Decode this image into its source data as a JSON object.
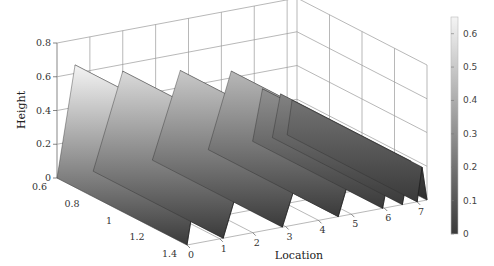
{
  "chart_data": {
    "type": "surface3d",
    "title": "",
    "xlabel": "Location",
    "ylabel": "",
    "zlabel": "Height",
    "x_ticks": [
      "0",
      "1",
      "2",
      "3",
      "4",
      "5",
      "6",
      "7"
    ],
    "y_ticks": [
      "0.6",
      "0.8",
      "1",
      "1.2",
      "1.4"
    ],
    "z_ticks": [
      "0",
      "0.2",
      "0.4",
      "0.6",
      "0.8"
    ],
    "xlim": [
      0,
      7.3
    ],
    "ylim": [
      0.6,
      1.4
    ],
    "zlim": [
      0,
      0.8
    ],
    "grid": true,
    "colormap": "gray",
    "colorbar": {
      "ticks": [
        "0",
        "0.1",
        "0.2",
        "0.3",
        "0.4",
        "0.5",
        "0.6"
      ],
      "range": [
        0,
        0.65
      ],
      "low_color": "#3a3a3a",
      "high_color": "#f2f2f2"
    },
    "series": [
      {
        "name": "ridge-1",
        "x_start": 0.0,
        "x_peak": 0.55,
        "x_end": 1.1,
        "height": 0.65
      },
      {
        "name": "ridge-2",
        "x_start": 1.1,
        "x_peak": 2.0,
        "x_end": 2.9,
        "height": 0.56
      },
      {
        "name": "ridge-3",
        "x_start": 2.9,
        "x_peak": 3.75,
        "x_end": 4.6,
        "height": 0.5
      },
      {
        "name": "ridge-4",
        "x_start": 4.6,
        "x_peak": 5.3,
        "x_end": 5.95,
        "height": 0.44
      },
      {
        "name": "ridge-5",
        "x_start": 5.95,
        "x_peak": 6.25,
        "x_end": 6.55,
        "height": 0.3
      },
      {
        "name": "ridge-6",
        "x_start": 6.55,
        "x_peak": 6.8,
        "x_end": 7.0,
        "height": 0.25
      },
      {
        "name": "ridge-7",
        "x_start": 7.0,
        "x_peak": 7.15,
        "x_end": 7.3,
        "height": 0.2
      }
    ]
  }
}
